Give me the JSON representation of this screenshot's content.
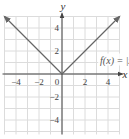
{
  "chart_data": {
    "type": "line",
    "title": "",
    "xlabel": "x",
    "ylabel": "y",
    "xlim": [
      -5,
      5
    ],
    "ylim": [
      -5,
      5
    ],
    "grid": true,
    "x_ticks": [
      -4,
      -2,
      0,
      2,
      4
    ],
    "y_ticks": [
      4,
      2,
      -2,
      -4
    ],
    "x_tick_labels": [
      "−4",
      "−2",
      "0",
      "2",
      "4"
    ],
    "y_tick_labels": [
      "4",
      "2",
      "−2",
      "−4"
    ],
    "series": [
      {
        "name": "f(x) = |x|",
        "x": [
          -5,
          -4,
          -3,
          -2,
          -1,
          0,
          1,
          2,
          3,
          4,
          5
        ],
        "y": [
          5,
          4,
          3,
          2,
          1,
          0,
          1,
          2,
          3,
          4,
          5
        ],
        "color": "#666666",
        "arrows_at_ends": true
      }
    ],
    "annotations": [
      {
        "text": "f(x) = |x|",
        "x": 3.4,
        "y": 1.0
      }
    ],
    "colors": {
      "grid": "#dcdcdc",
      "axis": "#444444",
      "curve": "#666666"
    }
  }
}
